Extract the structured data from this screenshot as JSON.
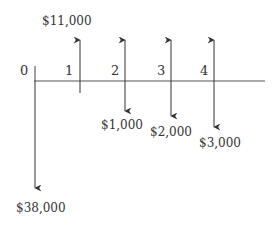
{
  "diagram": {
    "type": "cash-flow-diagram",
    "periods": [
      {
        "label": "0",
        "x": 35,
        "inflow": null,
        "outflow": "$38,000"
      },
      {
        "label": "1",
        "x": 80,
        "inflow": "$11,000",
        "outflow": null
      },
      {
        "label": "2",
        "x": 125,
        "inflow": "",
        "outflow": "$1,000"
      },
      {
        "label": "3",
        "x": 171,
        "inflow": "",
        "outflow": "$2,000"
      },
      {
        "label": "4",
        "x": 214,
        "inflow": "",
        "outflow": "$3,000"
      }
    ],
    "colors": {
      "line": "#333333",
      "text": "#333333",
      "background": "#ffffff"
    }
  },
  "labels": {
    "p0": "0",
    "p1": "1",
    "p2": "2",
    "p3": "3",
    "p4": "4",
    "in1": "$11,000",
    "out0": "$38,000",
    "out2": "$1,000",
    "out3": "$2,000",
    "out4": "$3,000"
  }
}
